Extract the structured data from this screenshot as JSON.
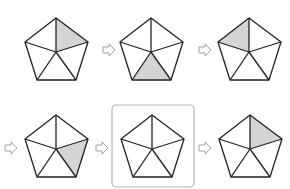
{
  "diagram": {
    "colors": {
      "stroke": "#222222",
      "shade": "#d4d4d4",
      "arrow_stroke": "#999999",
      "box_stroke": "#b5b5b5"
    },
    "steps": [
      {
        "id": "pentagon-1",
        "row": 1,
        "shaded_sector": "top-right",
        "boxed": false
      },
      {
        "id": "pentagon-2",
        "row": 1,
        "shaded_sector": "bottom",
        "boxed": false
      },
      {
        "id": "pentagon-3",
        "row": 1,
        "shaded_sector": "top-left",
        "boxed": false
      },
      {
        "id": "pentagon-4",
        "row": 2,
        "shaded_sector": "bottom-right",
        "boxed": false
      },
      {
        "id": "pentagon-5",
        "row": 2,
        "shaded_sector": null,
        "boxed": true
      },
      {
        "id": "pentagon-6",
        "row": 2,
        "shaded_sector": "top-right",
        "boxed": false
      }
    ],
    "arrows": [
      {
        "id": "arrow-1",
        "from": "pentagon-1",
        "to": "pentagon-2",
        "icon": "right-arrow-icon"
      },
      {
        "id": "arrow-2",
        "from": "pentagon-2",
        "to": "pentagon-3",
        "icon": "right-arrow-icon"
      },
      {
        "id": "arrow-3",
        "from": "pentagon-3",
        "to": "pentagon-4",
        "icon": "right-arrow-icon"
      },
      {
        "id": "arrow-4",
        "from": "pentagon-4",
        "to": "pentagon-5",
        "icon": "right-arrow-icon"
      },
      {
        "id": "arrow-5",
        "from": "pentagon-5",
        "to": "pentagon-6",
        "icon": "right-arrow-icon"
      }
    ]
  }
}
